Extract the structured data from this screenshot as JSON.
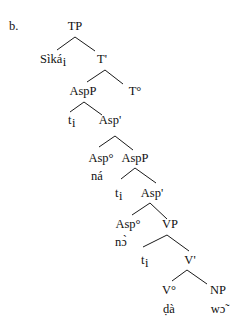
{
  "example_label": "b.",
  "tree": {
    "nodes": [
      {
        "id": "TP",
        "label": "TP",
        "x": 75,
        "y": 30,
        "anchor": "middle"
      },
      {
        "id": "Sika",
        "label": "Sìká",
        "sub": "i",
        "x": 40,
        "y": 63,
        "anchor": "start"
      },
      {
        "id": "Tbar",
        "label": "T'",
        "x": 102,
        "y": 63,
        "anchor": "middle"
      },
      {
        "id": "AspP1",
        "label": "AspP",
        "x": 83,
        "y": 95,
        "anchor": "middle"
      },
      {
        "id": "T0",
        "label": "T°",
        "x": 135,
        "y": 95,
        "anchor": "middle"
      },
      {
        "id": "t1",
        "label": "t",
        "sub": "i",
        "x": 68,
        "y": 124,
        "anchor": "start"
      },
      {
        "id": "Aspbar1",
        "label": "Asp'",
        "x": 110,
        "y": 124,
        "anchor": "middle"
      },
      {
        "id": "Asp0a",
        "label": "Asp°",
        "x": 101,
        "y": 162,
        "anchor": "middle"
      },
      {
        "id": "na",
        "label": "ná",
        "x": 91,
        "y": 180,
        "anchor": "start"
      },
      {
        "id": "AspP2",
        "label": "AspP",
        "x": 135,
        "y": 162,
        "anchor": "middle"
      },
      {
        "id": "t2",
        "label": "t",
        "sub": "i",
        "x": 115,
        "y": 197,
        "anchor": "start"
      },
      {
        "id": "Aspbar2",
        "label": "Asp'",
        "x": 152,
        "y": 197,
        "anchor": "middle"
      },
      {
        "id": "Asp0b",
        "label": "Asp°",
        "x": 128,
        "y": 228,
        "anchor": "middle"
      },
      {
        "id": "no",
        "label": "nɔ̀",
        "x": 115,
        "y": 246,
        "anchor": "start"
      },
      {
        "id": "VP",
        "label": "VP",
        "x": 170,
        "y": 228,
        "anchor": "middle"
      },
      {
        "id": "t3",
        "label": "t",
        "sub": "i",
        "x": 141,
        "y": 264,
        "anchor": "start"
      },
      {
        "id": "Vbar",
        "label": "V'",
        "x": 190,
        "y": 264,
        "anchor": "middle"
      },
      {
        "id": "V0",
        "label": "V°",
        "x": 169,
        "y": 294,
        "anchor": "middle"
      },
      {
        "id": "da",
        "label": "ḍà",
        "x": 169,
        "y": 313,
        "anchor": "middle"
      },
      {
        "id": "NP",
        "label": "NP",
        "x": 218,
        "y": 294,
        "anchor": "middle"
      },
      {
        "id": "wo",
        "label": "wɔ̃",
        "x": 218,
        "y": 313,
        "anchor": "middle"
      }
    ],
    "edges": [
      {
        "from": "TP",
        "to": "Sika",
        "x1": 75,
        "y1": 37,
        "x2": 57,
        "y2": 50
      },
      {
        "from": "TP",
        "to": "Tbar",
        "x1": 75,
        "y1": 37,
        "x2": 95,
        "y2": 51
      },
      {
        "from": "Tbar",
        "to": "AspP1",
        "x1": 105,
        "y1": 70,
        "x2": 87,
        "y2": 82
      },
      {
        "from": "Tbar",
        "to": "T0",
        "x1": 105,
        "y1": 70,
        "x2": 123,
        "y2": 84
      },
      {
        "from": "AspP1",
        "to": "t1",
        "x1": 84,
        "y1": 102,
        "x2": 70,
        "y2": 112
      },
      {
        "from": "AspP1",
        "to": "Aspbar1",
        "x1": 84,
        "y1": 102,
        "x2": 102,
        "y2": 115
      },
      {
        "from": "Aspbar1",
        "to": "Asp0a",
        "x1": 115,
        "y1": 136,
        "x2": 99,
        "y2": 147
      },
      {
        "from": "Aspbar1",
        "to": "AspP2",
        "x1": 115,
        "y1": 136,
        "x2": 133,
        "y2": 150
      },
      {
        "from": "AspP2",
        "to": "t2",
        "x1": 135,
        "y1": 168,
        "x2": 121,
        "y2": 179
      },
      {
        "from": "AspP2",
        "to": "Aspbar2",
        "x1": 135,
        "y1": 168,
        "x2": 156,
        "y2": 183
      },
      {
        "from": "Aspbar2",
        "to": "Asp0b",
        "x1": 150,
        "y1": 203,
        "x2": 132,
        "y2": 215
      },
      {
        "from": "Aspbar2",
        "to": "VP",
        "x1": 150,
        "y1": 203,
        "x2": 167,
        "y2": 219
      },
      {
        "from": "VP",
        "to": "t3",
        "x1": 167,
        "y1": 235,
        "x2": 143,
        "y2": 247
      },
      {
        "from": "VP",
        "to": "Vbar",
        "x1": 167,
        "y1": 235,
        "x2": 189,
        "y2": 251
      },
      {
        "from": "Vbar",
        "to": "V0",
        "x1": 187,
        "y1": 270,
        "x2": 172,
        "y2": 281
      },
      {
        "from": "Vbar",
        "to": "NP",
        "x1": 187,
        "y1": 270,
        "x2": 207,
        "y2": 284
      }
    ]
  }
}
